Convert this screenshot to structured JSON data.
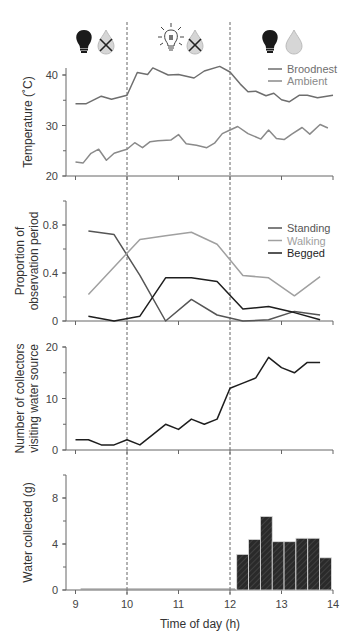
{
  "x_axis": {
    "label": "Time of day (h)",
    "ticks": [
      9,
      10,
      11,
      12,
      13,
      14
    ],
    "range": [
      9,
      14
    ]
  },
  "period_icons": [
    {
      "name": "dark-no-water",
      "light": "dark-bulb",
      "water": "water-drop-crossed"
    },
    {
      "name": "light-no-water",
      "light": "lit-bulb",
      "water": "water-drop-crossed"
    },
    {
      "name": "dark-water",
      "light": "dark-bulb",
      "water": "water-drop"
    }
  ],
  "period_boundaries": [
    10,
    12
  ],
  "chart_data": [
    {
      "type": "line",
      "title": "",
      "xlabel": "",
      "ylabel": "Temperature (˚C)",
      "ylim": [
        20,
        42
      ],
      "yticks": [
        20,
        30,
        40
      ],
      "legend_position": "top-right",
      "series": [
        {
          "name": "Broodnest",
          "color": "#6e6e6e",
          "x": [
            9.0,
            9.2,
            9.5,
            9.7,
            10.0,
            10.2,
            10.4,
            10.5,
            10.8,
            11.0,
            11.3,
            11.5,
            11.8,
            12.0,
            12.2,
            12.35,
            12.5,
            12.7,
            12.85,
            13.0,
            13.15,
            13.35,
            13.5,
            13.7,
            14.0
          ],
          "values": [
            34.3,
            34.3,
            35.8,
            35.2,
            36.0,
            40.5,
            40.1,
            41.4,
            40.0,
            40.1,
            39.4,
            40.8,
            41.7,
            40.6,
            38.2,
            36.7,
            36.8,
            35.9,
            36.4,
            35.1,
            34.7,
            36.0,
            36.0,
            35.5,
            36.0
          ]
        },
        {
          "name": "Ambient",
          "color": "#8a8a8a",
          "x": [
            9.0,
            9.15,
            9.3,
            9.45,
            9.6,
            9.75,
            9.9,
            10.0,
            10.15,
            10.3,
            10.45,
            10.6,
            10.85,
            11.0,
            11.15,
            11.35,
            11.55,
            11.7,
            11.85,
            12.0,
            12.15,
            12.35,
            12.6,
            12.75,
            12.9,
            13.05,
            13.2,
            13.4,
            13.55,
            13.75,
            13.9
          ],
          "values": [
            22.8,
            22.6,
            24.5,
            25.3,
            23.1,
            24.5,
            25.0,
            25.3,
            26.6,
            25.6,
            26.8,
            27.0,
            27.1,
            28.2,
            26.4,
            26.1,
            25.6,
            26.5,
            28.4,
            29.1,
            29.8,
            28.4,
            27.3,
            29.1,
            27.4,
            27.2,
            28.3,
            29.6,
            28.3,
            30.2,
            29.5
          ]
        }
      ]
    },
    {
      "type": "line",
      "title": "",
      "xlabel": "",
      "ylabel": "Proportion of observation period",
      "ylim": [
        0,
        1.0
      ],
      "yticks": [
        0,
        0.4,
        0.8
      ],
      "legend_position": "top-right",
      "series": [
        {
          "name": "Standing",
          "color": "#555555",
          "x": [
            9.25,
            9.75,
            10.25,
            10.75,
            11.25,
            11.75,
            12.25,
            12.75,
            13.25,
            13.75
          ],
          "values": [
            0.75,
            0.72,
            0.38,
            0.0,
            0.18,
            0.05,
            0.0,
            0.01,
            0.08,
            0.05
          ]
        },
        {
          "name": "Walking",
          "color": "#a0a0a0",
          "x": [
            9.25,
            9.75,
            10.25,
            10.75,
            11.25,
            11.75,
            12.25,
            12.75,
            13.25,
            13.75
          ],
          "values": [
            0.22,
            0.45,
            0.68,
            0.71,
            0.74,
            0.64,
            0.38,
            0.36,
            0.21,
            0.37
          ]
        },
        {
          "name": "Begged",
          "color": "#1e1e1e",
          "x": [
            9.25,
            9.75,
            10.25,
            10.75,
            11.25,
            11.75,
            12.25,
            12.75,
            13.25,
            13.75
          ],
          "values": [
            0.04,
            0.0,
            0.04,
            0.36,
            0.36,
            0.33,
            0.1,
            0.12,
            0.07,
            0.01
          ]
        }
      ]
    },
    {
      "type": "line",
      "title": "",
      "xlabel": "",
      "ylabel": "Number of collectors visiting water source",
      "ylim": [
        0,
        20
      ],
      "yticks": [
        0,
        10,
        20
      ],
      "series": [
        {
          "name": "Collectors",
          "color": "#1e1e1e",
          "x": [
            9.0,
            9.25,
            9.5,
            9.75,
            10.0,
            10.25,
            10.5,
            10.75,
            11.0,
            11.25,
            11.5,
            11.75,
            12.0,
            12.25,
            12.5,
            12.75,
            13.0,
            13.25,
            13.5,
            13.75
          ],
          "values": [
            2,
            2,
            1,
            1,
            2,
            1,
            3,
            5,
            4,
            6,
            5,
            6,
            12,
            13,
            14,
            18,
            16,
            15,
            17,
            17
          ]
        }
      ]
    },
    {
      "type": "bar",
      "title": "",
      "xlabel": "Time of day (h)",
      "ylabel": "Water collected (g)",
      "ylim": [
        0,
        10
      ],
      "yticks": [
        0,
        4,
        8
      ],
      "baseline_line": {
        "from": 9.1,
        "to": 12.1,
        "value": 0
      },
      "series": [
        {
          "name": "Water collected",
          "color": "#2a2a2a",
          "x_start": [
            12.13,
            12.36,
            12.59,
            12.82,
            13.05,
            13.28,
            13.51,
            13.74
          ],
          "width": 0.23,
          "values": [
            3.1,
            4.4,
            6.4,
            4.2,
            4.2,
            4.5,
            4.5,
            2.8
          ]
        }
      ]
    }
  ]
}
